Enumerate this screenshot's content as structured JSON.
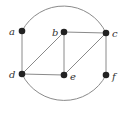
{
  "graph": {
    "nodes": [
      {
        "id": "a",
        "label": "a",
        "x": 22,
        "y": 31
      },
      {
        "id": "b",
        "label": "b",
        "x": 64,
        "y": 32
      },
      {
        "id": "c",
        "label": "c",
        "x": 106,
        "y": 33
      },
      {
        "id": "d",
        "label": "d",
        "x": 22,
        "y": 74
      },
      {
        "id": "e",
        "label": "e",
        "x": 64,
        "y": 75
      },
      {
        "id": "f",
        "label": "f",
        "x": 106,
        "y": 75
      }
    ],
    "edges": [
      {
        "from": "a",
        "to": "d",
        "type": "line"
      },
      {
        "from": "b",
        "to": "c",
        "type": "line"
      },
      {
        "from": "b",
        "to": "d",
        "type": "line"
      },
      {
        "from": "b",
        "to": "e",
        "type": "line"
      },
      {
        "from": "c",
        "to": "e",
        "type": "line"
      },
      {
        "from": "c",
        "to": "f",
        "type": "line"
      },
      {
        "from": "d",
        "to": "e",
        "type": "line"
      },
      {
        "from": "a",
        "to": "c",
        "type": "arc-top"
      },
      {
        "from": "d",
        "to": "f",
        "type": "arc-bottom"
      }
    ],
    "colors": {
      "edge": "#8a8a8a",
      "node": "#222222",
      "label": "#333333"
    }
  }
}
